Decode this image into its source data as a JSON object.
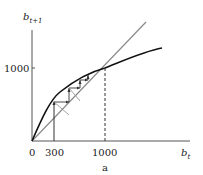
{
  "figure": {
    "panel_label": "a",
    "y_axis": {
      "name": "b",
      "subscript": "t+1",
      "tick_label": "1000"
    },
    "x_axis": {
      "name": "b",
      "subscript": "t",
      "tick_labels": [
        "0",
        "300",
        "1000"
      ]
    }
  },
  "colors": {
    "curve": "#111111",
    "diagonal": "#8a8a8a",
    "axes": "#555555",
    "cobweb": "#333333"
  },
  "diagram": {
    "start_value": 300,
    "equilibrium": 1000
  }
}
